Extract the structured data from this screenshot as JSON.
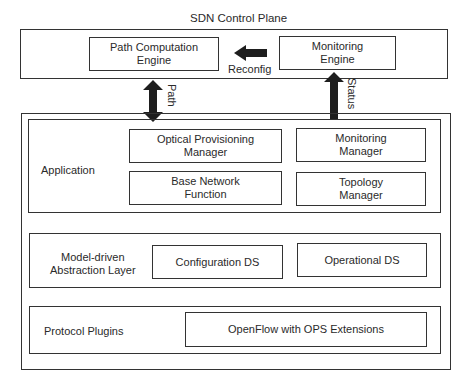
{
  "control_plane": {
    "title": "SDN Control Plane",
    "path_computation_engine": "Path Computation\nEngine",
    "monitoring_engine": "Monitoring\nEngine",
    "reconfig_label": "Reconfig"
  },
  "arrows": {
    "path_label": "Path",
    "status_label": "Status"
  },
  "controller": {
    "application": {
      "label": "Application",
      "boxes": [
        "Optical Provisioning\nManager",
        "Monitoring\nManager",
        "Base Network\nFunction",
        "Topology\nManager"
      ]
    },
    "abstraction_layer": {
      "label": "Model-driven\nAbstraction Layer",
      "boxes": [
        "Configuration DS",
        "Operational DS"
      ]
    },
    "protocol_plugins": {
      "label": "Protocol Plugins",
      "boxes": [
        "OpenFlow with OPS Extensions"
      ]
    }
  },
  "colors": {
    "stroke": "#333333",
    "arrow": "#1e1e1e",
    "background": "#ffffff"
  }
}
